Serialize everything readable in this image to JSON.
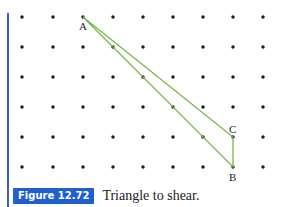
{
  "figure": {
    "number_label": "Figure 12.72",
    "caption": "Triangle to shear.",
    "accent_color": "#1f5fd0",
    "line_color": "#7ab648"
  },
  "grid": {
    "x": [
      22,
      53,
      83,
      113,
      143,
      173,
      203,
      233,
      263
    ],
    "y": [
      17,
      47,
      77,
      107,
      137,
      167
    ]
  },
  "points": {
    "A": {
      "label": "A",
      "x": 83,
      "y": 17
    },
    "B": {
      "label": "B",
      "x": 233,
      "y": 167
    },
    "C": {
      "label": "C",
      "x": 233,
      "y": 137
    }
  }
}
